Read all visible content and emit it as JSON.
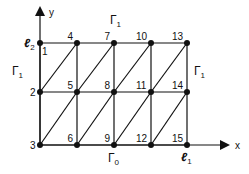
{
  "diagram": {
    "type": "triangulated-mesh",
    "axes": {
      "x_label": "x",
      "y_label": "y"
    },
    "columns_x": [
      40,
      77,
      114,
      151,
      187
    ],
    "rows_y": [
      43,
      92,
      145
    ],
    "nodes": [
      {
        "id": "1",
        "col": 0,
        "row": 0
      },
      {
        "id": "2",
        "col": 0,
        "row": 1
      },
      {
        "id": "3",
        "col": 0,
        "row": 2
      },
      {
        "id": "4",
        "col": 1,
        "row": 0
      },
      {
        "id": "5",
        "col": 1,
        "row": 1
      },
      {
        "id": "6",
        "col": 1,
        "row": 2
      },
      {
        "id": "7",
        "col": 2,
        "row": 0
      },
      {
        "id": "8",
        "col": 2,
        "row": 1
      },
      {
        "id": "9",
        "col": 2,
        "row": 2
      },
      {
        "id": "10",
        "col": 3,
        "row": 0
      },
      {
        "id": "11",
        "col": 3,
        "row": 1
      },
      {
        "id": "12",
        "col": 3,
        "row": 2
      },
      {
        "id": "13",
        "col": 4,
        "row": 0
      },
      {
        "id": "14",
        "col": 4,
        "row": 1
      },
      {
        "id": "15",
        "col": 4,
        "row": 2
      }
    ],
    "boundary_labels": {
      "gamma1_top": {
        "main": "Γ",
        "sub": "1"
      },
      "gamma1_left": {
        "main": "Γ",
        "sub": "1"
      },
      "gamma1_right": {
        "main": "Γ",
        "sub": "1"
      },
      "gamma0_bottom": {
        "main": "Γ",
        "sub": "0"
      }
    },
    "length_labels": {
      "l2": {
        "main": "ℓ",
        "sub": "2"
      },
      "l1": {
        "main": "ℓ",
        "sub": "1"
      }
    }
  }
}
